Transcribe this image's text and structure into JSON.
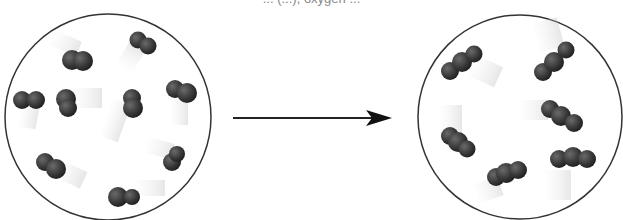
{
  "caption": "... (...), oxygen ...",
  "diagram": {
    "left_container": {
      "label": "oxygen gas (O2)",
      "molecule_count": 9,
      "atoms_per_molecule": 2
    },
    "arrow": {
      "direction": "right"
    },
    "right_container": {
      "label": "ozone gas (O3)",
      "molecule_count": 6,
      "atoms_per_molecule": 3
    },
    "colors": {
      "atom": "#3a3a3a",
      "outline": "#222222",
      "motion_blur": "#cfcfcf"
    }
  }
}
